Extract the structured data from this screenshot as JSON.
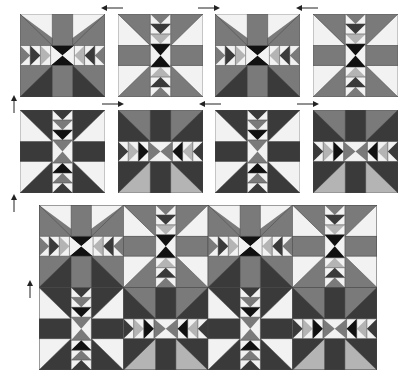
{
  "diagram": {
    "colors": {
      "black": "#111111",
      "dark": "#3a3a3a",
      "medium": "#7a7a7a",
      "light": "#b4b4b4",
      "white": "#f2f2f2",
      "outline": "#555555"
    },
    "block_types": {
      "A": "horizontal-flying-geese-band block (star/hourglass center, geese pointing inward left-right)",
      "B": "vertical-flying-geese-band block (hourglass center, geese pointing inward top-bottom)"
    },
    "row1": {
      "blocks": [
        {
          "type": "A",
          "variant": "gray-top-dark-bottom"
        },
        {
          "type": "B",
          "variant": "gray-light"
        },
        {
          "type": "A",
          "variant": "gray-top-dark-bottom"
        },
        {
          "type": "B",
          "variant": "gray-light"
        }
      ],
      "arrows": [
        {
          "direction": "left",
          "label": "press-left"
        },
        {
          "direction": "right",
          "label": "press-right"
        },
        {
          "direction": "left",
          "label": "press-left"
        }
      ]
    },
    "row2": {
      "blocks": [
        {
          "type": "B",
          "variant": "dark-light"
        },
        {
          "type": "A",
          "variant": "dark-top-gray-bottom"
        },
        {
          "type": "B",
          "variant": "dark-light"
        },
        {
          "type": "A",
          "variant": "dark-top-gray-bottom"
        }
      ],
      "arrows": [
        {
          "direction": "right",
          "label": "press-right"
        },
        {
          "direction": "left",
          "label": "press-left"
        },
        {
          "direction": "right",
          "label": "press-right"
        }
      ]
    },
    "row_arrows": [
      {
        "direction": "up",
        "label": "press-up"
      },
      {
        "direction": "up",
        "label": "press-up"
      },
      {
        "direction": "up",
        "label": "press-up"
      }
    ],
    "assembled_quilt": {
      "rows": 2,
      "cols": 4,
      "row1": [
        "A-gray",
        "B-gray",
        "A-gray",
        "B-gray"
      ],
      "row2": [
        "B-dark",
        "A-dark",
        "B-dark",
        "A-dark"
      ]
    }
  }
}
